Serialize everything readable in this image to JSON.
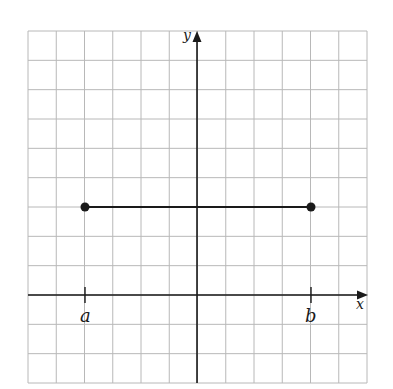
{
  "diagram": {
    "type": "coordinate-plane",
    "grid": {
      "columns": 12,
      "rows": 12
    },
    "axes": {
      "x_label": "x",
      "y_label": "y"
    },
    "segment": {
      "start_label": "a",
      "end_label": "b",
      "y_value": 3,
      "start_x_units": -4,
      "end_x_units": 4,
      "endpoints": "closed"
    },
    "colors": {
      "grid": "#b8b8b8",
      "ink": "#1a1a1a",
      "background": "#ffffff"
    }
  }
}
